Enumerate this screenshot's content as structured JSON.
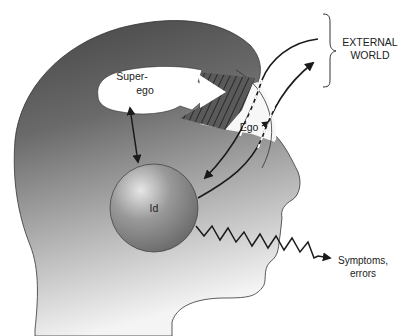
{
  "diagram": {
    "type": "freud-structural-model",
    "labels": {
      "superego_line1": "Super-",
      "superego_line2": "ego",
      "ego": "Ego",
      "id": "Id",
      "external_line1": "EXTERNAL",
      "external_line2": "WORLD",
      "symptoms_line1": "Symptoms,",
      "symptoms_line2": "errors"
    },
    "colors": {
      "head_dark": "#4a4a4a",
      "head_light": "#f2f2f2",
      "id_sphere": "#8c8c8c",
      "ink": "#1a1a1a",
      "background": "#ffffff"
    }
  }
}
